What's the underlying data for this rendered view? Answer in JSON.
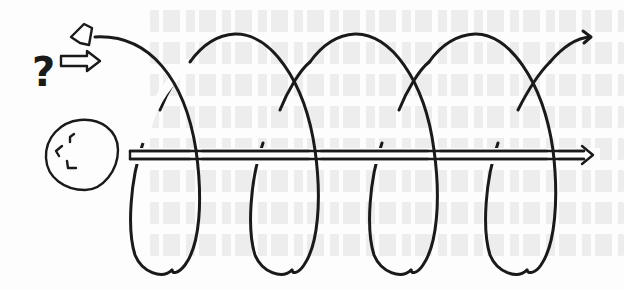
{
  "diagram": {
    "colors": {
      "ink": "#1a1a1a",
      "background": "#fdfdfd"
    },
    "elements": {
      "bell_icon": "bell-shape",
      "question_mark": "?",
      "hollow_arrow": "right-pointing hollow arrow",
      "circle_face": "circle with broken strokes",
      "helix": {
        "loops": 4,
        "arc_tops_x": [
          235,
          355,
          475
        ],
        "loop_bottoms_x": [
          155,
          273,
          393,
          510
        ]
      },
      "axis_arrow": {
        "style": "double-line",
        "from_x": 130,
        "to_x": 593,
        "y": 155
      },
      "helix_end_arrow": {
        "x": 590,
        "y": 36
      }
    }
  }
}
